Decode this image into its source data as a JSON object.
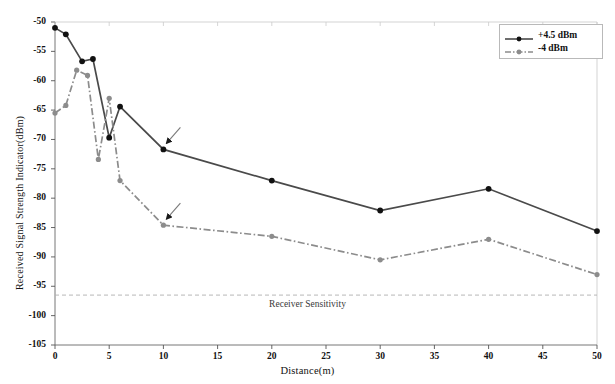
{
  "chart_data": {
    "type": "line",
    "title": "",
    "xlabel": "Distance(m)",
    "ylabel": "Received Signal Strength Indicator(dBm)",
    "xlim": [
      0,
      50
    ],
    "ylim": [
      -105,
      -50
    ],
    "xticks": [
      0,
      5,
      10,
      15,
      20,
      25,
      30,
      35,
      40,
      45,
      50
    ],
    "xtick_labels": [
      "0",
      "5",
      "10",
      "15",
      "20",
      "25",
      "30",
      "35",
      "40",
      "45",
      "50"
    ],
    "yticks": [
      -50,
      -55,
      -60,
      -65,
      -70,
      -75,
      -80,
      -85,
      -90,
      -95,
      -100,
      -105
    ],
    "ytick_labels": [
      "-50",
      "-55",
      "-60",
      "-65",
      "-70",
      "-75",
      "-80",
      "-85",
      "-90",
      "-95",
      "-100",
      "-105"
    ],
    "grid": false,
    "legend_position": "top-right",
    "series": [
      {
        "name": "+4.5 dBm",
        "color": "#4a4a4a",
        "linestyle": "solid",
        "marker": "circle",
        "x": [
          0,
          1,
          2.5,
          3.5,
          5,
          6,
          10,
          20,
          30,
          40,
          50
        ],
        "values": [
          -51.0,
          -52.1,
          -56.7,
          -56.3,
          -69.7,
          -64.4,
          -71.7,
          -77.0,
          -82.1,
          -78.4,
          -85.6
        ]
      },
      {
        "name": "-4 dBm",
        "color": "#8c8c8c",
        "linestyle": "dashdot",
        "marker": "circle",
        "x": [
          0,
          1,
          2,
          3,
          4,
          5,
          6,
          10,
          20,
          30,
          40,
          50
        ],
        "values": [
          -65.5,
          -64.2,
          -58.2,
          -59.1,
          -73.4,
          -63.0,
          -77.0,
          -84.6,
          -86.5,
          -90.5,
          -87.0,
          -93.0
        ]
      }
    ],
    "reference_lines": [
      {
        "label": "Receiver Sensitivity",
        "value": -96.5,
        "orientation": "horizontal",
        "linestyle": "dashed",
        "color": "#b0b0b0"
      }
    ],
    "annotations": [
      {
        "text": "",
        "marker": "arrow",
        "target_x": 10,
        "target_y": -71.7
      },
      {
        "text": "",
        "marker": "arrow",
        "target_x": 10,
        "target_y": -84.6
      }
    ]
  },
  "legend": {
    "items": [
      {
        "label": "+4.5 dBm"
      },
      {
        "label": "-4 dBm"
      }
    ]
  },
  "axes": {
    "x_title": "Distance(m)",
    "y_title": "Received Signal Strength Indicator(dBm)"
  },
  "reference": {
    "sensitivity_label": "Receiver Sensitivity"
  }
}
